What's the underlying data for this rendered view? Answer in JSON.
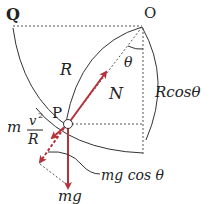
{
  "diagram": {
    "points": {
      "Q": "Q",
      "O": "O",
      "P": "P"
    },
    "labels": {
      "radius": "R",
      "angle": "θ",
      "normal_force": "N",
      "vertical_component": "Rcosθ",
      "centripetal_m": "m",
      "centripetal_num": "v",
      "centripetal_exp": "2",
      "centripetal_den": "R",
      "weight": "mg",
      "weight_component": "mg cos θ"
    },
    "colors": {
      "force_arrow": "#b5323a",
      "line": "#333333"
    }
  }
}
